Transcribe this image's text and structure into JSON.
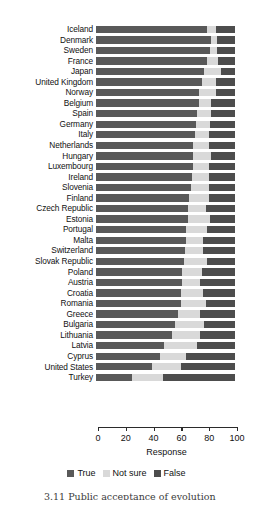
{
  "caption": "3.11  Public acceptance of evolution",
  "legend": {
    "position": "bottom-center",
    "items": [
      {
        "label": "True",
        "color": "#595959",
        "icon": "legend-swatch"
      },
      {
        "label": "Not sure",
        "color": "#d9d9d9",
        "icon": "legend-swatch"
      },
      {
        "label": "False",
        "color": "#4d4d4d",
        "icon": "legend-swatch"
      }
    ]
  },
  "chart_data": {
    "type": "bar",
    "orientation": "horizontal",
    "stacked": true,
    "stack_total": 100,
    "title": "",
    "xlabel": "Response",
    "ylabel": "",
    "xlim": [
      0,
      100
    ],
    "xticks": [
      0,
      20,
      40,
      60,
      80,
      100
    ],
    "grid": false,
    "legend_position": "bottom-center",
    "colors": {
      "True": "#595959",
      "Not sure": "#d9d9d9",
      "False": "#4d4d4d"
    },
    "categories": [
      "Iceland",
      "Denmark",
      "Sweden",
      "France",
      "Japan",
      "United Kingdom",
      "Norway",
      "Belgium",
      "Spain",
      "Germany",
      "Italy",
      "Netherlands",
      "Hungary",
      "Luxembourg",
      "Ireland",
      "Slovenia",
      "Finland",
      "Czech Republic",
      "Estonia",
      "Portugal",
      "Malta",
      "Switzerland",
      "Slovak Republic",
      "Poland",
      "Austria",
      "Croatia",
      "Romania",
      "Greece",
      "Bulgaria",
      "Lithuania",
      "Latvia",
      "Cyprus",
      "United States",
      "Turkey"
    ],
    "series": [
      {
        "name": "True",
        "values": [
          80,
          83,
          82,
          80,
          78,
          76,
          74,
          74,
          73,
          72,
          71,
          70,
          70,
          70,
          69,
          68,
          67,
          66,
          66,
          65,
          65,
          64,
          63,
          62,
          62,
          61,
          61,
          59,
          57,
          55,
          49,
          46,
          40,
          26
        ]
      },
      {
        "name": "Not sure",
        "values": [
          6,
          4,
          5,
          8,
          12,
          10,
          12,
          9,
          10,
          10,
          10,
          11,
          13,
          11,
          12,
          13,
          14,
          13,
          16,
          15,
          12,
          13,
          17,
          14,
          13,
          16,
          18,
          16,
          21,
          20,
          24,
          19,
          21,
          22
        ]
      },
      {
        "name": "False",
        "values": [
          14,
          13,
          13,
          12,
          10,
          14,
          14,
          17,
          17,
          18,
          19,
          19,
          17,
          19,
          19,
          19,
          19,
          21,
          18,
          20,
          23,
          23,
          20,
          24,
          25,
          23,
          21,
          25,
          22,
          25,
          27,
          35,
          39,
          52
        ]
      }
    ]
  }
}
